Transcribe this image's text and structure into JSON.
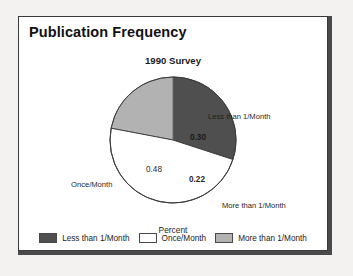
{
  "panel": {
    "title": "Publication Frequency"
  },
  "chart_data": {
    "type": "pie",
    "title": "1990 Survey",
    "xlabel": "Percent",
    "ylabel": "",
    "grid": false,
    "legend_position": "bottom",
    "start_angle_deg": 0,
    "direction": "clockwise",
    "categories": [
      "Less than 1/Month",
      "Once/Month",
      "More than 1/Month"
    ],
    "values": [
      0.3,
      0.48,
      0.22
    ],
    "value_labels": [
      "0.30",
      "0.48",
      "0.22"
    ],
    "colors": [
      "#4f4f4f",
      "#ffffff",
      "#b2b2b2"
    ],
    "slices": [
      {
        "name": "Less than 1/Month",
        "value": 0.3,
        "value_label": "0.30",
        "color": "#4f4f4f",
        "callout": "Less than 1/Month"
      },
      {
        "name": "Once/Month",
        "value": 0.48,
        "value_label": "0.48",
        "color": "#ffffff",
        "callout": "Once/Month"
      },
      {
        "name": "More than 1/Month",
        "value": 0.22,
        "value_label": "0.22",
        "color": "#b2b2b2",
        "callout": "More than 1/Month"
      }
    ],
    "legend": [
      {
        "label": "Less than 1/Month",
        "color": "#4f4f4f"
      },
      {
        "label": "Once/Month",
        "color": "#ffffff"
      },
      {
        "label": "More than 1/Month",
        "color": "#b2b2b2"
      }
    ]
  }
}
